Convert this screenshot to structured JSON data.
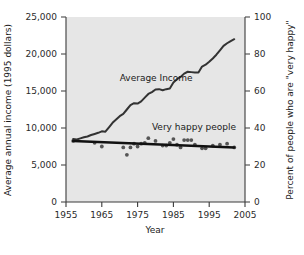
{
  "chart_data": {
    "type": "line",
    "title": "",
    "xlabel": "Year",
    "ylabel": "Average annual income (1995 dollars)",
    "ylabel_right": "Percent of people who are \"very happy\"",
    "xlim": [
      1955,
      2005
    ],
    "ylim": [
      0,
      25000
    ],
    "ylim_right": [
      0,
      100
    ],
    "xticks": [
      1955,
      1965,
      1975,
      1985,
      1995,
      2005
    ],
    "xtick_labels": [
      "1955",
      "1965",
      "1975",
      "1985",
      "1995",
      "2005"
    ],
    "yticks": [
      0,
      5000,
      10000,
      15000,
      20000,
      25000
    ],
    "ytick_labels": [
      "0",
      "5,000",
      "10,000",
      "15,000",
      "20,000",
      "25,000"
    ],
    "yticks_right": [
      0,
      20,
      40,
      60,
      80,
      100
    ],
    "ytick_labels_right": [
      "0",
      "20",
      "40",
      "60",
      "80",
      "100"
    ],
    "grid": false,
    "plot_background": "#e6e6e6",
    "legend_position": "inline-annotation",
    "series": [
      {
        "name": "Average Income",
        "axis": "left",
        "annotation": "Average Income",
        "annotation_x": 1970,
        "annotation_y": 16400,
        "color": "#333333",
        "style": "line",
        "x": [
          1957,
          1958,
          1959,
          1960,
          1961,
          1962,
          1963,
          1964,
          1965,
          1966,
          1967,
          1968,
          1969,
          1970,
          1971,
          1972,
          1973,
          1974,
          1975,
          1976,
          1977,
          1978,
          1979,
          1980,
          1981,
          1982,
          1983,
          1984,
          1985,
          1986,
          1987,
          1988,
          1989,
          1990,
          1991,
          1992,
          1993,
          1994,
          1995,
          1996,
          1997,
          1998,
          1999,
          2000,
          2001,
          2002
        ],
        "values": [
          8500,
          8450,
          8600,
          8750,
          8850,
          9050,
          9200,
          9350,
          9550,
          9500,
          10100,
          10700,
          11150,
          11600,
          11900,
          12500,
          13100,
          13350,
          13300,
          13600,
          14100,
          14600,
          14850,
          15200,
          15250,
          15100,
          15250,
          15350,
          16150,
          16600,
          16900,
          17350,
          17600,
          17550,
          17500,
          17500,
          18300,
          18550,
          18950,
          19400,
          19900,
          20500,
          21100,
          21450,
          21750,
          22000
        ]
      },
      {
        "name": "Very happy people",
        "axis": "right",
        "annotation": "Very happy people",
        "annotation_x": 1979,
        "annotation_y_pct": 39,
        "color": "#111111",
        "style": "scatter+trendline",
        "trend_x": [
          1957,
          2002
        ],
        "trend_values_pct": [
          33.0,
          29.5
        ],
        "points": [
          {
            "x": 1957,
            "pct": 33.0
          },
          {
            "x": 1963,
            "pct": 32.0
          },
          {
            "x": 1965,
            "pct": 30.0
          },
          {
            "x": 1971,
            "pct": 29.5
          },
          {
            "x": 1972,
            "pct": 25.5
          },
          {
            "x": 1973,
            "pct": 29.5
          },
          {
            "x": 1974,
            "pct": 31.5
          },
          {
            "x": 1975,
            "pct": 30.0
          },
          {
            "x": 1976,
            "pct": 31.5
          },
          {
            "x": 1977,
            "pct": 32.0
          },
          {
            "x": 1978,
            "pct": 34.5
          },
          {
            "x": 1980,
            "pct": 33.0
          },
          {
            "x": 1982,
            "pct": 30.5
          },
          {
            "x": 1983,
            "pct": 30.5
          },
          {
            "x": 1984,
            "pct": 32.0
          },
          {
            "x": 1985,
            "pct": 34.0
          },
          {
            "x": 1986,
            "pct": 31.0
          },
          {
            "x": 1987,
            "pct": 29.5
          },
          {
            "x": 1988,
            "pct": 33.5
          },
          {
            "x": 1989,
            "pct": 33.5
          },
          {
            "x": 1990,
            "pct": 33.5
          },
          {
            "x": 1991,
            "pct": 31.0
          },
          {
            "x": 1993,
            "pct": 29.0
          },
          {
            "x": 1994,
            "pct": 29.0
          },
          {
            "x": 1996,
            "pct": 30.5
          },
          {
            "x": 1998,
            "pct": 31.0
          },
          {
            "x": 2000,
            "pct": 31.5
          },
          {
            "x": 2002,
            "pct": 29.5
          }
        ]
      }
    ]
  }
}
